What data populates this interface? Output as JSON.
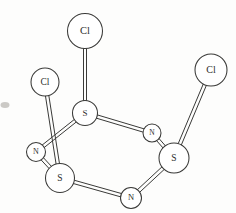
{
  "figure": {
    "kind": "ball-and-stick-molecular-structure",
    "caption": "",
    "background_color": "#fdfdfc",
    "line_color": "#3a3a38",
    "atom_fill_color": "#ffffff",
    "label_color": "#2e2e2c"
  },
  "atoms": [
    {
      "id": "cl-top",
      "label": "Cl",
      "element": "Cl",
      "cx": 85,
      "cy": 31,
      "r": 17.5,
      "font_size": 10.5
    },
    {
      "id": "cl-left",
      "label": "Cl",
      "element": "Cl",
      "cx": 45,
      "cy": 82,
      "r": 14.0,
      "font_size": 9.5
    },
    {
      "id": "cl-right",
      "label": "Cl",
      "element": "Cl",
      "cx": 211,
      "cy": 70,
      "r": 16.0,
      "font_size": 10.0
    },
    {
      "id": "s-top",
      "label": "S",
      "element": "S",
      "cx": 85,
      "cy": 113,
      "r": 12.5,
      "font_size": 9.0
    },
    {
      "id": "s-left",
      "label": "S",
      "element": "S",
      "cx": 60,
      "cy": 178,
      "r": 14.5,
      "font_size": 9.5
    },
    {
      "id": "s-right",
      "label": "S",
      "element": "S",
      "cx": 174,
      "cy": 158,
      "r": 15.0,
      "font_size": 9.5
    },
    {
      "id": "n-left",
      "label": "N",
      "element": "N",
      "cx": 36,
      "cy": 152,
      "r": 9.5,
      "font_size": 8.0
    },
    {
      "id": "n-upright",
      "label": "N",
      "element": "N",
      "cx": 152,
      "cy": 133,
      "r": 9.0,
      "font_size": 7.5
    },
    {
      "id": "n-bottom",
      "label": "N",
      "element": "N",
      "cx": 131,
      "cy": 198,
      "r": 10.5,
      "font_size": 8.5
    }
  ],
  "bonds": [
    {
      "id": "bond-cl-top--s-top",
      "from": "cl-top",
      "to": "s-top",
      "style": "double-line",
      "width": 3.0
    },
    {
      "id": "bond-cl-left--s-left",
      "from": "cl-left",
      "to": "s-left",
      "style": "double-line",
      "width": 3.4
    },
    {
      "id": "bond-cl-right--s-right",
      "from": "cl-right",
      "to": "s-right",
      "style": "double-line",
      "width": 3.4
    },
    {
      "id": "bond-s-top--n-upright",
      "from": "s-top",
      "to": "n-upright",
      "style": "double-line",
      "width": 3.4
    },
    {
      "id": "bond-n-upright--s-right",
      "from": "n-upright",
      "to": "s-right",
      "style": "double-line",
      "width": 3.2
    },
    {
      "id": "bond-s-right--n-bottom",
      "from": "s-right",
      "to": "n-bottom",
      "style": "double-line",
      "width": 3.4
    },
    {
      "id": "bond-n-bottom--s-left",
      "from": "n-bottom",
      "to": "s-left",
      "style": "double-line",
      "width": 3.4
    },
    {
      "id": "bond-s-left--n-left",
      "from": "s-left",
      "to": "n-left",
      "style": "double-line",
      "width": 3.2
    },
    {
      "id": "bond-n-left--s-top",
      "from": "n-left",
      "to": "s-top",
      "style": "double-line",
      "width": 3.2
    }
  ],
  "artifacts": [
    {
      "id": "edge-smudge",
      "cx": 5,
      "cy": 105,
      "rx": 4.5,
      "ry": 3.0
    }
  ]
}
